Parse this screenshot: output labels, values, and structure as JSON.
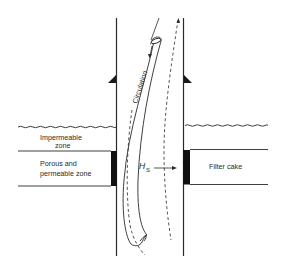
{
  "diagram": {
    "labels": {
      "impermeable_line1": "Impermeable",
      "impermeable_line2": "zone",
      "porous_line1": "Porous and",
      "porous_line2": "permeable zone",
      "filter_cake": "Filter cake",
      "circulation": "Circulation",
      "hs_main": "H",
      "hs_sub": "S"
    },
    "colors": {
      "ink": "#2a2a2a",
      "cake": "#111111",
      "background": "#ffffff"
    }
  }
}
